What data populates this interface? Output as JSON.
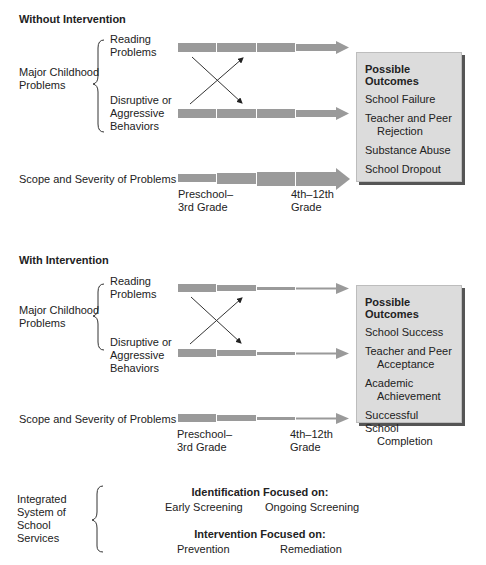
{
  "without": {
    "title": "Without Intervention",
    "major_label_1": "Major Childhood",
    "major_label_2": "Problems",
    "reading_1": "Reading",
    "reading_2": "Problems",
    "disruptive_1": "Disruptive or",
    "disruptive_2": "Aggressive",
    "disruptive_3": "Behaviors",
    "scope_label": "Scope and Severity of Problems",
    "grade_start_1": "Preschool–",
    "grade_start_2": "3rd Grade",
    "grade_end_1": "4th–12th",
    "grade_end_2": "Grade",
    "outcomes": {
      "title": "Possible Outcomes",
      "items": [
        {
          "line1": "School Failure",
          "line2": ""
        },
        {
          "line1": "Teacher and Peer",
          "line2": "Rejection"
        },
        {
          "line1": "Substance Abuse",
          "line2": ""
        },
        {
          "line1": "School Dropout",
          "line2": ""
        }
      ]
    }
  },
  "with": {
    "title": "With Intervention",
    "major_label_1": "Major Childhood",
    "major_label_2": "Problems",
    "reading_1": "Reading",
    "reading_2": "Problems",
    "disruptive_1": "Disruptive or",
    "disruptive_2": "Aggressive",
    "disruptive_3": "Behaviors",
    "scope_label": "Scope and Severity of Problems",
    "grade_start_1": "Preschool–",
    "grade_start_2": "3rd Grade",
    "grade_end_1": "4th–12th",
    "grade_end_2": "Grade",
    "outcomes": {
      "title": "Possible Outcomes",
      "items": [
        {
          "line1": "School Success",
          "line2": ""
        },
        {
          "line1": "Teacher and Peer",
          "line2": "Acceptance"
        },
        {
          "line1": "Academic",
          "line2": "Achievement"
        },
        {
          "line1": "Successful School",
          "line2": "Completion"
        }
      ]
    }
  },
  "services": {
    "label_1": "Integrated",
    "label_2": "System of",
    "label_3": "School",
    "label_4": "Services",
    "identification_title": "Identification Focused on:",
    "identification_items": [
      "Early Screening",
      "Ongoing Screening"
    ],
    "intervention_title": "Intervention Focused on:",
    "intervention_items": [
      "Prevention",
      "Remediation"
    ]
  },
  "colors": {
    "bar": "#9a9a9a",
    "box_bg": "#dcdcdc",
    "box_shadow": "#555555",
    "text": "#222222"
  }
}
